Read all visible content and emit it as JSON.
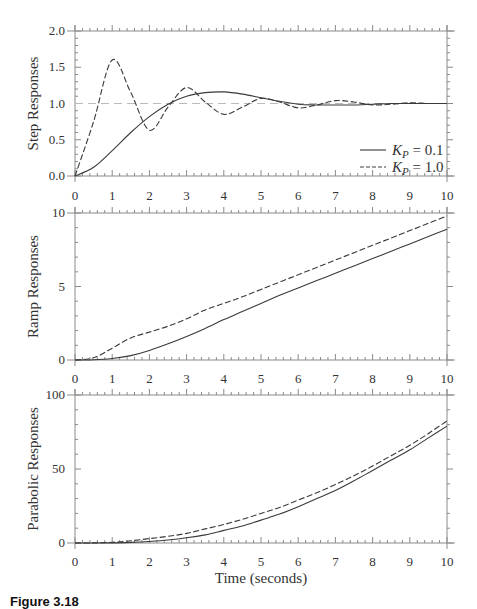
{
  "figure": {
    "xlabel": "Time (seconds)",
    "caption": "Figure 3.18"
  },
  "chart_data": [
    {
      "type": "line",
      "title": "",
      "xlabel": "",
      "ylabel": "Step Responses",
      "xlim": [
        0,
        10
      ],
      "ylim": [
        0,
        2.0
      ],
      "xticks": [
        "0",
        "1",
        "2",
        "3",
        "4",
        "5",
        "6",
        "7",
        "8",
        "9",
        "10"
      ],
      "yticks": [
        "0.0",
        "0.5",
        "1.0",
        "1.5",
        "2.0"
      ],
      "grid": false,
      "reference_line": {
        "y": 1.0,
        "style": "dashed-light"
      },
      "legend": {
        "position": "lower right",
        "entries": [
          {
            "label": "K_P = 0.1",
            "style": "solid"
          },
          {
            "label": "K_P = 1.0",
            "style": "dashed"
          }
        ]
      },
      "x": [
        0,
        0.5,
        1,
        1.5,
        2,
        2.5,
        3,
        3.5,
        4,
        4.5,
        5,
        5.5,
        6,
        6.5,
        7,
        7.5,
        8,
        8.5,
        9,
        9.5,
        10
      ],
      "series": [
        {
          "name": "K_P = 0.1",
          "style": "solid",
          "values": [
            0,
            0.12,
            0.35,
            0.6,
            0.82,
            0.99,
            1.1,
            1.15,
            1.16,
            1.13,
            1.08,
            1.03,
            0.99,
            0.98,
            0.98,
            0.98,
            0.99,
            1.0,
            1.0,
            1.0,
            1.0
          ]
        },
        {
          "name": "K_P = 1.0",
          "style": "dashed",
          "values": [
            0,
            0.75,
            1.6,
            1.15,
            0.63,
            0.95,
            1.22,
            1.02,
            0.85,
            0.95,
            1.07,
            1.02,
            0.94,
            0.98,
            1.04,
            1.02,
            0.98,
            0.99,
            1.01,
            1.0,
            1.0
          ]
        }
      ]
    },
    {
      "type": "line",
      "title": "",
      "xlabel": "",
      "ylabel": "Ramp Responses",
      "xlim": [
        0,
        10
      ],
      "ylim": [
        0,
        10
      ],
      "xticks": [
        "0",
        "1",
        "2",
        "3",
        "4",
        "5",
        "6",
        "7",
        "8",
        "9",
        "10"
      ],
      "yticks": [
        "0",
        "5",
        "10"
      ],
      "grid": false,
      "x": [
        0,
        0.5,
        1,
        1.5,
        2,
        2.5,
        3,
        3.5,
        4,
        4.5,
        5,
        5.5,
        6,
        6.5,
        7,
        7.5,
        8,
        8.5,
        9,
        9.5,
        10
      ],
      "series": [
        {
          "name": "K_P = 0.1",
          "style": "solid",
          "values": [
            0,
            0.02,
            0.1,
            0.3,
            0.65,
            1.1,
            1.6,
            2.15,
            2.75,
            3.3,
            3.85,
            4.4,
            4.9,
            5.4,
            5.9,
            6.4,
            6.9,
            7.4,
            7.9,
            8.4,
            8.9
          ]
        },
        {
          "name": "K_P = 1.0",
          "style": "dashed",
          "values": [
            0,
            0.15,
            0.8,
            1.5,
            1.9,
            2.3,
            2.8,
            3.4,
            3.85,
            4.3,
            4.8,
            5.3,
            5.8,
            6.3,
            6.8,
            7.3,
            7.8,
            8.3,
            8.8,
            9.3,
            9.8
          ]
        }
      ]
    },
    {
      "type": "line",
      "title": "",
      "xlabel": "Time (seconds)",
      "ylabel": "Parabolic Responses",
      "xlim": [
        0,
        10
      ],
      "ylim": [
        0,
        100
      ],
      "xticks": [
        "0",
        "1",
        "2",
        "3",
        "4",
        "5",
        "6",
        "7",
        "8",
        "9",
        "10"
      ],
      "yticks": [
        "0",
        "50",
        "100"
      ],
      "grid": false,
      "x": [
        0,
        0.5,
        1,
        1.5,
        2,
        2.5,
        3,
        3.5,
        4,
        4.5,
        5,
        5.5,
        6,
        6.5,
        7,
        7.5,
        8,
        8.5,
        9,
        9.5,
        10
      ],
      "series": [
        {
          "name": "K_P = 0.1",
          "style": "solid",
          "values": [
            0,
            0,
            0.1,
            0.4,
            1.0,
            2.0,
            3.5,
            5.5,
            8.5,
            11.5,
            15.5,
            19.5,
            24.5,
            30,
            35.5,
            42,
            49,
            56,
            63,
            71,
            79
          ]
        },
        {
          "name": "K_P = 1.0",
          "style": "dashed",
          "values": [
            0,
            0.05,
            0.5,
            1.5,
            3.0,
            4.5,
            6.5,
            9.5,
            12.5,
            16,
            20,
            24,
            29,
            34,
            39.5,
            45.5,
            52,
            59,
            66,
            74,
            82.5
          ]
        }
      ]
    }
  ]
}
